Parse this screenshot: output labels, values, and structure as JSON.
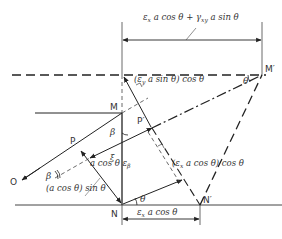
{
  "diagram": {
    "points": {
      "M": "M",
      "M_prime": "M′",
      "N": "N",
      "N_prime": "N′",
      "P": "P",
      "P_prime": "P′",
      "O": "O"
    },
    "labels": {
      "top_dimension": "εx a cos θ + γxy a sin θ",
      "top_dim_a": "ε",
      "top_dim_a_sub": "x",
      "top_dim_b": " a cos θ + γ",
      "top_dim_b_sub": "xy",
      "top_dim_c": " a sin θ",
      "ey_term": "(ε",
      "ey_sub": "y",
      "ey_rest": " a sin θ) cos θ",
      "ex_term": "(ε",
      "ex_sub": "x",
      "ex_rest": " a cos θ) cos θ",
      "acos_sin": "(a cos θ) sin θ",
      "acos_eb": "a cos θ ε",
      "eb_sub": "β",
      "bottom_dim": "ε",
      "bottom_dim_sub": "x",
      "bottom_dim_rest": " a cos θ",
      "theta_top": "θ",
      "theta_bottom": "θ",
      "beta_1": "β",
      "beta_2": "β",
      "xi": "ξ"
    },
    "colors": {
      "line": "#222222",
      "text": "#333333",
      "background": "#ffffff"
    }
  }
}
